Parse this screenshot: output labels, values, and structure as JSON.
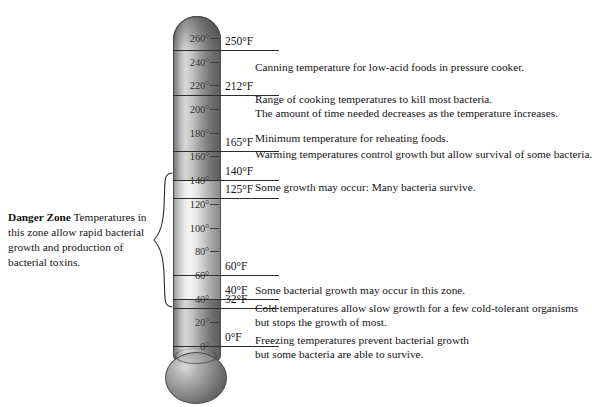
{
  "diagram": {
    "unit": "°F"
  },
  "chart_data": {
    "type": "bar",
    "xlabel": "",
    "ylabel": "Temperature (°F)",
    "ylim": [
      0,
      270
    ],
    "grid": false,
    "legend": "none",
    "categories": [
      "0",
      "20",
      "40",
      "60",
      "80",
      "100",
      "120",
      "140",
      "160",
      "180",
      "200",
      "220",
      "240",
      "260"
    ],
    "values": [
      0,
      20,
      40,
      60,
      80,
      100,
      120,
      140,
      160,
      180,
      200,
      220,
      240,
      260
    ],
    "annotations": [
      {
        "value": 250,
        "label": "250°F",
        "text": "Canning temperature for low-acid foods in pressure cooker."
      },
      {
        "value": 212,
        "label": "212°F",
        "text": "Range of cooking temperatures to kill most bacteria. The amount of time needed decreases as the temperature increases."
      },
      {
        "value": 165,
        "label": "165°F",
        "text": "Minimum temperature for reheating foods. Warming temperatures control growth but allow survival of some bacteria."
      },
      {
        "value": 140,
        "label": "140°F",
        "text": ""
      },
      {
        "value": 125,
        "label": "125°F",
        "text": "Some growth may occur: Many bacteria survive."
      },
      {
        "value": 60,
        "label": "60°F",
        "text": ""
      },
      {
        "value": 40,
        "label": "40°F",
        "text": "Some bacterial growth may occur in this zone."
      },
      {
        "value": 32,
        "label": "32°F",
        "text": "Cold temperatures allow slow growth for a few cold-tolerant organisms but stops the growth of most."
      },
      {
        "value": 0,
        "label": "0°F",
        "text": "Freezing temperatures prevent bacterial growth but some bacteria are able to survive."
      }
    ],
    "zones": [
      {
        "name": "Danger Zone",
        "from": 40,
        "to": 140,
        "note": "Temperatures in this zone allow rapid bacterial growth and production of bacterial toxins."
      }
    ]
  },
  "scale": {
    "ticks": [
      {
        "label": "260°"
      },
      {
        "label": "240°"
      },
      {
        "label": "220°"
      },
      {
        "label": "200°"
      },
      {
        "label": "180°"
      },
      {
        "label": "160°"
      },
      {
        "label": "140°"
      },
      {
        "label": "120°"
      },
      {
        "label": "100°"
      },
      {
        "label": "80°"
      },
      {
        "label": "60°"
      },
      {
        "label": "40°"
      },
      {
        "label": "20°"
      },
      {
        "label": "0°"
      }
    ]
  },
  "references": {
    "r250": "250°F",
    "r212": "212°F",
    "r165": "165°F",
    "r140": "140°F",
    "r125": "125°F",
    "r60": "60°F",
    "r40": "40°F",
    "r32": "32°F",
    "r0": "0°F"
  },
  "notes": {
    "canning": "Canning temperature for low-acid foods in pressure cooker.",
    "cooking_1": "Range of cooking temperatures to kill most bacteria.",
    "cooking_2": "The amount of time needed decreases as the temperature increases.",
    "reheating_1": "Minimum temperature for reheating foods.",
    "reheating_2": "Warming temperatures control growth but allow survival of some bacteria.",
    "some_growth": "Some growth may occur: Many bacteria survive.",
    "bacterial_growth": "Some bacterial growth may occur in this zone.",
    "cold_1": "Cold temperatures allow slow growth for a few cold-tolerant organisms",
    "cold_2": "but stops the growth of most.",
    "freezing_1": "Freezing temperatures prevent bacterial growth",
    "freezing_2": "but some bacteria are able to survive."
  },
  "danger_zone": {
    "title": "Danger Zone",
    "text": " Temperatures in this zone allow rapid bacterial growth and production of bacterial toxins."
  },
  "colors": {
    "tube_light": "#f4f4f4",
    "tube_dark": "#5c5c5c",
    "ink": "#141414"
  }
}
